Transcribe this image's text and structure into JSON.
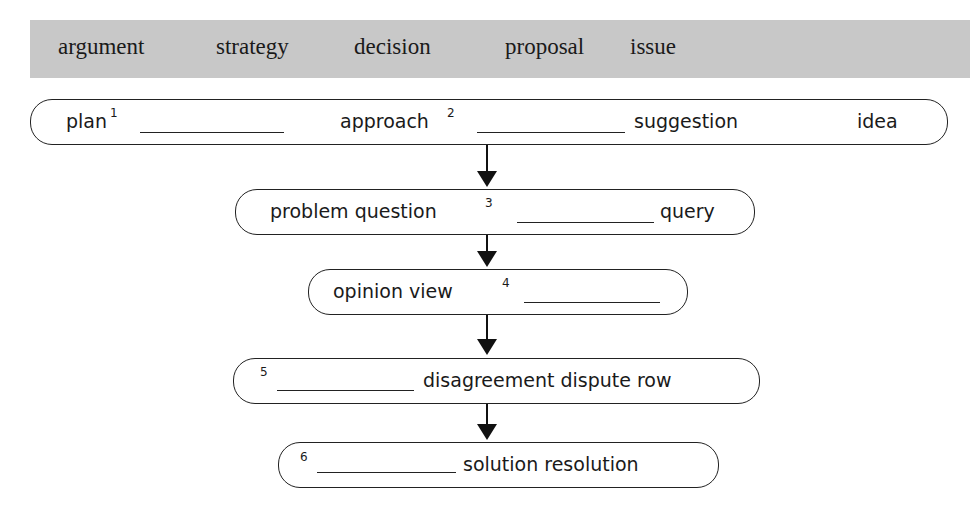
{
  "word_bank": {
    "words": [
      "argument",
      "strategy",
      "decision",
      "proposal",
      "issue"
    ]
  },
  "flow": [
    {
      "number": "1",
      "words_before": "plan",
      "words_after": "",
      "extra": [
        "approach"
      ]
    },
    {
      "row1": {
        "plan": "plan",
        "n1": "1",
        "approach": "approach",
        "n2": "2",
        "suggestion": "suggestion",
        "idea": "idea"
      }
    },
    {
      "row2": {
        "text1": "problem question",
        "n3": "3",
        "text2": "query"
      }
    },
    {
      "row3": {
        "text1": "opinion view",
        "n4": "4"
      }
    },
    {
      "row4": {
        "n5": "5",
        "text2": "disagreement dispute row"
      }
    },
    {
      "row5": {
        "n6": "6",
        "text2": "solution resolution"
      }
    }
  ]
}
